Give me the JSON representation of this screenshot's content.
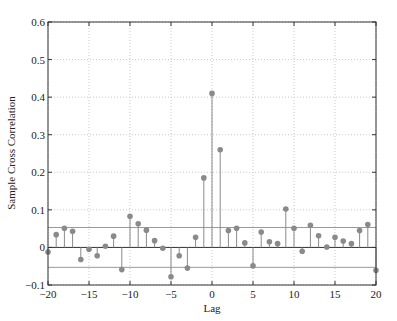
{
  "chart_data": {
    "type": "stem",
    "title": "",
    "xlabel": "Lag",
    "ylabel": "Sample Cross Correlation",
    "xlim": [
      -20,
      20
    ],
    "ylim": [
      -0.1,
      0.6
    ],
    "xticks": [
      -20,
      -15,
      -10,
      -5,
      0,
      5,
      10,
      15,
      20
    ],
    "yticks": [
      -0.1,
      0,
      0.1,
      0.2,
      0.3,
      0.4,
      0.5,
      0.6
    ],
    "xtick_labels": [
      "−20",
      "−15",
      "−10",
      "−5",
      "0",
      "5",
      "10",
      "15",
      "20"
    ],
    "ytick_labels": [
      "−0.1",
      "0",
      "0.1",
      "0.2",
      "0.3",
      "0.4",
      "0.5",
      "0.6"
    ],
    "grid": true,
    "confidence_bounds": [
      0.053,
      -0.053
    ],
    "x": [
      -20,
      -19,
      -18,
      -17,
      -16,
      -15,
      -14,
      -13,
      -12,
      -11,
      -10,
      -9,
      -8,
      -7,
      -6,
      -5,
      -4,
      -3,
      -2,
      -1,
      0,
      1,
      2,
      3,
      4,
      5,
      6,
      7,
      8,
      9,
      10,
      11,
      12,
      13,
      14,
      15,
      16,
      17,
      18,
      19,
      20
    ],
    "values": [
      -0.012,
      0.034,
      0.051,
      0.043,
      -0.032,
      -0.005,
      -0.022,
      0.003,
      0.03,
      -0.059,
      0.083,
      0.063,
      0.046,
      0.018,
      -0.002,
      -0.078,
      -0.022,
      -0.055,
      0.027,
      0.185,
      0.41,
      0.26,
      0.045,
      0.051,
      0.012,
      -0.049,
      0.041,
      0.015,
      0.01,
      0.102,
      0.051,
      -0.01,
      0.059,
      0.031,
      0.001,
      0.027,
      0.017,
      0.01,
      0.045,
      0.061,
      -0.061
    ],
    "colors": {
      "stem": "#8a8a8a",
      "zero_line": "#333333",
      "bound": "#999999",
      "grid": "#c8c8c8",
      "axis": "#333333"
    }
  }
}
